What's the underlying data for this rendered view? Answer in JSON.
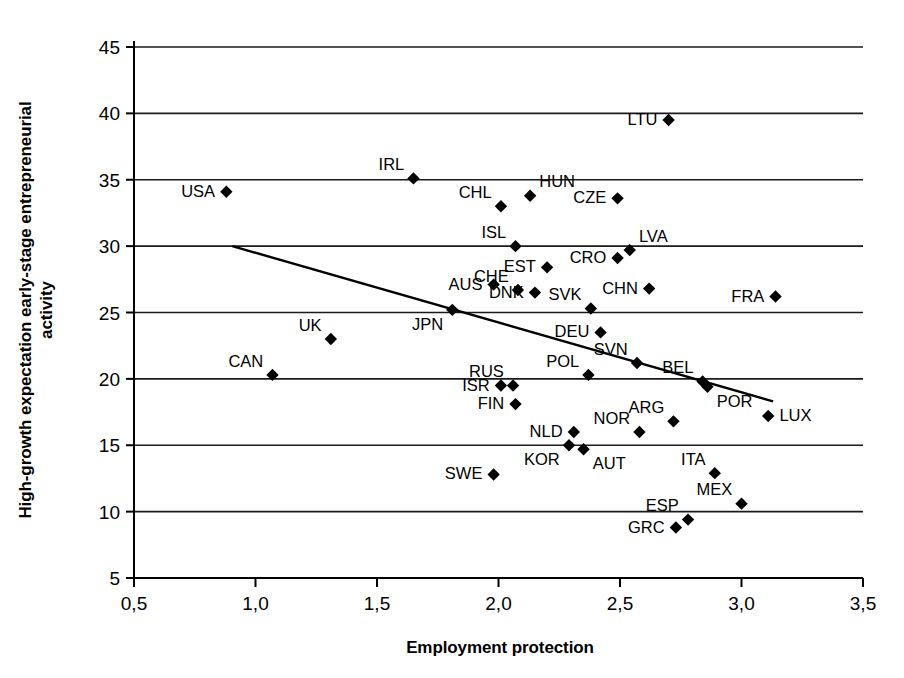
{
  "chart_data": {
    "type": "scatter",
    "title": "",
    "xlabel": "Employment protection",
    "ylabel_lines": [
      "High-growth expectation early-stage entrepreneurial",
      "activity"
    ],
    "xlim": [
      0.5,
      3.5
    ],
    "ylim": [
      5,
      45
    ],
    "xticks": [
      "0,5",
      "1,0",
      "1,5",
      "2,0",
      "2,5",
      "3,0",
      "3,5"
    ],
    "xtick_values": [
      0.5,
      1.0,
      1.5,
      2.0,
      2.5,
      3.0,
      3.5
    ],
    "yticks": [
      "5",
      "10",
      "15",
      "20",
      "25",
      "30",
      "35",
      "40",
      "45"
    ],
    "ytick_values": [
      5,
      10,
      15,
      20,
      25,
      30,
      35,
      40,
      45
    ],
    "grid": "horizontal",
    "legend": "none",
    "marker": "filled-diamond",
    "marker_color": "#000000",
    "line_color": "#000000",
    "trendline": {
      "name": "linear-fit",
      "x_start": 0.905,
      "y_start": 30.0,
      "x_end": 3.13,
      "y_end": 18.3
    },
    "points": [
      {
        "label": "USA",
        "x": 0.88,
        "y": 34.1,
        "label_pos": "left"
      },
      {
        "label": "CAN",
        "x": 1.07,
        "y": 20.3,
        "label_pos": "upper-left"
      },
      {
        "label": "UK",
        "x": 1.31,
        "y": 23.0,
        "label_pos": "upper-left"
      },
      {
        "label": "IRL",
        "x": 1.65,
        "y": 35.1,
        "label_pos": "upper-left"
      },
      {
        "label": "JPN",
        "x": 1.81,
        "y": 25.2,
        "label_pos": "lower-left"
      },
      {
        "label": "AUS",
        "x": 1.98,
        "y": 27.1,
        "label_pos": "left"
      },
      {
        "label": "SWE",
        "x": 1.98,
        "y": 12.8,
        "label_pos": "left"
      },
      {
        "label": "ISR",
        "x": 2.01,
        "y": 19.5,
        "label_pos": "left"
      },
      {
        "label": "CHL",
        "x": 2.01,
        "y": 33.0,
        "label_pos": "upper-left"
      },
      {
        "label": "RUS",
        "x": 2.06,
        "y": 19.5,
        "label_pos": "upper-left"
      },
      {
        "label": "ISL",
        "x": 2.07,
        "y": 30.0,
        "label_pos": "upper-left"
      },
      {
        "label": "FIN",
        "x": 2.07,
        "y": 18.1,
        "label_pos": "left"
      },
      {
        "label": "CHE",
        "x": 2.08,
        "y": 26.7,
        "label_pos": "upper-left"
      },
      {
        "label": "HUN",
        "x": 2.13,
        "y": 33.8,
        "label_pos": "upper-right"
      },
      {
        "label": "DNK",
        "x": 2.15,
        "y": 26.5,
        "label_pos": "left"
      },
      {
        "label": "EST",
        "x": 2.2,
        "y": 28.4,
        "label_pos": "left"
      },
      {
        "label": "NLD",
        "x": 2.31,
        "y": 16.0,
        "label_pos": "left"
      },
      {
        "label": "KOR",
        "x": 2.29,
        "y": 15.0,
        "label_pos": "lower-left"
      },
      {
        "label": "AUT",
        "x": 2.35,
        "y": 14.7,
        "label_pos": "lower-right"
      },
      {
        "label": "POL",
        "x": 2.37,
        "y": 20.3,
        "label_pos": "upper-left"
      },
      {
        "label": "SVK",
        "x": 2.38,
        "y": 25.3,
        "label_pos": "upper-left"
      },
      {
        "label": "DEU",
        "x": 2.42,
        "y": 23.5,
        "label_pos": "left"
      },
      {
        "label": "CZE",
        "x": 2.49,
        "y": 33.6,
        "label_pos": "left"
      },
      {
        "label": "CRO",
        "x": 2.49,
        "y": 29.1,
        "label_pos": "left"
      },
      {
        "label": "LVA",
        "x": 2.54,
        "y": 29.7,
        "label_pos": "upper-right"
      },
      {
        "label": "SVN",
        "x": 2.57,
        "y": 21.2,
        "label_pos": "upper-left"
      },
      {
        "label": "NOR",
        "x": 2.58,
        "y": 16.0,
        "label_pos": "upper-left"
      },
      {
        "label": "CHN",
        "x": 2.62,
        "y": 26.8,
        "label_pos": "left"
      },
      {
        "label": "ARG",
        "x": 2.72,
        "y": 16.8,
        "label_pos": "upper-left"
      },
      {
        "label": "LTU",
        "x": 2.7,
        "y": 39.5,
        "label_pos": "left"
      },
      {
        "label": "GRC",
        "x": 2.73,
        "y": 8.8,
        "label_pos": "left"
      },
      {
        "label": "ESP",
        "x": 2.78,
        "y": 9.4,
        "label_pos": "upper-left"
      },
      {
        "label": "BEL",
        "x": 2.84,
        "y": 19.8,
        "label_pos": "upper-left"
      },
      {
        "label": "POR",
        "x": 2.86,
        "y": 19.4,
        "label_pos": "lower-right"
      },
      {
        "label": "ITA",
        "x": 2.89,
        "y": 12.9,
        "label_pos": "upper-left"
      },
      {
        "label": "MEX",
        "x": 3.0,
        "y": 10.6,
        "label_pos": "upper-left"
      },
      {
        "label": "LUX",
        "x": 3.11,
        "y": 17.2,
        "label_pos": "right"
      },
      {
        "label": "FRA",
        "x": 3.14,
        "y": 26.2,
        "label_pos": "left"
      }
    ]
  }
}
